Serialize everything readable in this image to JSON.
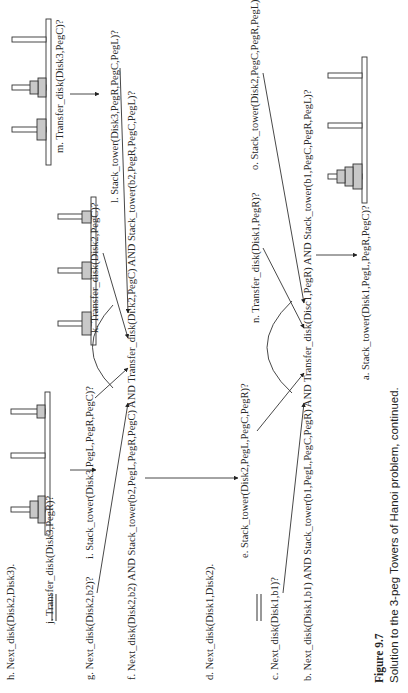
{
  "figure": {
    "number": "Figure 9.7",
    "caption": "Solution to the 3-peg Towers of Hanoi problem, continued."
  },
  "labels": {
    "a": "a. Stack_tower(Disk1,PegL,PegR,PegC)?",
    "b": "b. Next_disk(Disk1,b1) AND Stack_tower(b1,PegL,PegC,PegR) AND Transfer_disk(Disc1,PegR) AND Stack_tower(b1,PegC,PegR,PegL)?",
    "c": "c. Next_disk(Disk1,b1)?",
    "d": "d. Next_disk(Disk1,Disk2).",
    "e": "e. Stack_tower(Disk2,PegL,PegC,PegR)?",
    "f": "f. Next_disk(Disk2,b2) AND Stack_tower(b2,PegL,PegR,PegC) AND Transfer_disk(Di:k2,PegC) AND Stack_tower(b2,PegR,PegC,PegL)?",
    "g": "g. Next_disk(Disk2,b2)?",
    "h": "h. Next_disk(Disk2,Disk3).",
    "i": "i. Stack_tower(Disk3,PegL,PegR,PegC)?",
    "j": "j. Transfer_disk(Disk3,PegR)?",
    "k": "k. Transfer_disk(Disk2,PegC)?",
    "l": "l. Stack_tower(Disk3,PegR,PegC,PegL)?",
    "m": "m. Transfer_disk(Disk3,PegC)?",
    "n": "n. Transfer_disk(Disk1,PegR)?",
    "o": "o. Stack_tower(Disk2,PegC,PegR,PegL)?"
  },
  "towers": {
    "j_state": {
      "left": [
        "Disk1",
        "Disk2"
      ],
      "center": [],
      "right": [
        "Disk3"
      ]
    },
    "k_state": {
      "left": [
        "Disk1"
      ],
      "center": [
        "Disk2"
      ],
      "right": [
        "Disk3"
      ]
    },
    "m_state": {
      "left": [
        "Disk1"
      ],
      "center": [
        "Disk2",
        "Disk3"
      ],
      "right": []
    },
    "final_state": {
      "left": [
        "Disk1",
        "Disk2",
        "Disk3"
      ],
      "center": [],
      "right": []
    }
  },
  "colors": {
    "disk_fill": "#c8c8c8",
    "stroke": "#333333",
    "background": "#ffffff"
  }
}
